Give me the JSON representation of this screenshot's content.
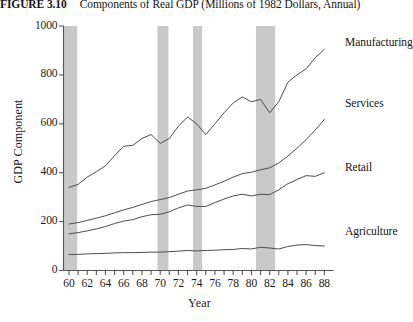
{
  "figure": {
    "number": "FIGURE 3.10",
    "caption": "Components of Real GDP (Millions of 1982 Dollars, Annual)"
  },
  "colors": {
    "line": "#4d4d4d",
    "axis": "#555555",
    "recession_band": "#c9c9c9",
    "text": "#141414",
    "background": "#ffffff"
  },
  "chart_data": {
    "type": "line",
    "title": "Components of Real GDP (Millions of 1982 Dollars, Annual)",
    "xlabel": "Year",
    "ylabel": "GDP Component",
    "xlim": [
      59.4,
      89.0
    ],
    "ylim": [
      0,
      1000
    ],
    "xticks": [
      60,
      61,
      62,
      63,
      64,
      65,
      66,
      67,
      68,
      69,
      70,
      71,
      72,
      73,
      74,
      75,
      76,
      77,
      78,
      79,
      80,
      81,
      82,
      83,
      84,
      85,
      86,
      87,
      88
    ],
    "xtick_labels": [
      "60",
      "62",
      "64",
      "66",
      "68",
      "70",
      "72",
      "74",
      "76",
      "78",
      "80",
      "82",
      "84",
      "86",
      "88"
    ],
    "xtick_labeled_values": [
      60,
      62,
      64,
      66,
      68,
      70,
      72,
      74,
      76,
      78,
      80,
      82,
      84,
      86,
      88
    ],
    "yticks": [
      0,
      200,
      400,
      600,
      800,
      1000
    ],
    "ytick_labels": [
      "0",
      "200",
      "400",
      "600",
      "800",
      "1000"
    ],
    "grid": false,
    "legend_position": "right-inline-annotations",
    "x": [
      60,
      61,
      62,
      63,
      64,
      65,
      66,
      67,
      68,
      69,
      70,
      71,
      72,
      73,
      74,
      75,
      76,
      77,
      78,
      79,
      80,
      81,
      82,
      83,
      84,
      85,
      86,
      87,
      88
    ],
    "series": [
      {
        "name": "Manufacturing",
        "values": [
          340,
          352,
          382,
          404,
          428,
          470,
          508,
          512,
          540,
          556,
          520,
          540,
          590,
          628,
          600,
          556,
          600,
          645,
          685,
          710,
          690,
          700,
          645,
          690,
          770,
          800,
          825,
          870,
          905
        ]
      },
      {
        "name": "Services",
        "values": [
          190,
          196,
          205,
          214,
          224,
          236,
          248,
          258,
          270,
          282,
          290,
          298,
          312,
          325,
          330,
          336,
          350,
          365,
          382,
          396,
          402,
          412,
          420,
          440,
          468,
          500,
          535,
          575,
          618
        ]
      },
      {
        "name": "Retail",
        "values": [
          150,
          155,
          162,
          170,
          180,
          192,
          202,
          208,
          220,
          228,
          230,
          240,
          256,
          268,
          262,
          262,
          278,
          292,
          305,
          312,
          305,
          312,
          310,
          330,
          355,
          372,
          388,
          385,
          400
        ]
      },
      {
        "name": "Agriculture",
        "values": [
          65,
          66,
          68,
          69,
          70,
          72,
          73,
          73,
          74,
          75,
          75,
          77,
          79,
          82,
          80,
          82,
          83,
          85,
          86,
          90,
          88,
          95,
          92,
          88,
          98,
          104,
          106,
          102,
          100
        ]
      }
    ],
    "recession_bands": [
      {
        "start": 59.4,
        "end": 60.9
      },
      {
        "start": 69.7,
        "end": 70.9
      },
      {
        "start": 73.6,
        "end": 74.6
      },
      {
        "start": 80.5,
        "end": 82.6
      }
    ]
  }
}
